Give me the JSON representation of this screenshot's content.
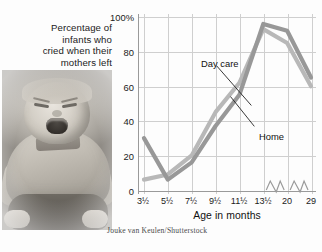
{
  "title_lines": [
    "Percentage of",
    "infants who",
    "cried when their",
    "mothers left"
  ],
  "credit": "Jouke van Keulen/Shutterstock",
  "photo": {
    "alt_name": "crying-infant-photo"
  },
  "chart_data": {
    "type": "line",
    "title": "Percentage of infants who cried when their mothers left",
    "xlabel": "Age in months",
    "ylabel": "",
    "categories": [
      "3½",
      "5½",
      "7½",
      "9½",
      "11½",
      "13½",
      "20",
      "29"
    ],
    "x_tick_labels": [
      "3½",
      "5½",
      "7½",
      "9½",
      "11½",
      "13½",
      "20",
      "29"
    ],
    "y_tick_labels": [
      "0",
      "20",
      "40",
      "60",
      "80",
      "100%"
    ],
    "y_tick_values": [
      0,
      20,
      40,
      60,
      80,
      100
    ],
    "ylim": [
      0,
      100
    ],
    "grid": true,
    "legend": "inline-annotations",
    "axis_breaks": true,
    "series": [
      {
        "name": "Day care",
        "color": "#b8b8b8",
        "values": [
          6,
          9,
          20,
          45,
          62,
          93,
          85,
          60
        ]
      },
      {
        "name": "Home",
        "color": "#989898",
        "values": [
          30,
          6,
          16,
          37,
          55,
          96,
          92,
          65
        ]
      }
    ],
    "annotations": [
      {
        "text": "Day care",
        "points_to_series": "Day care"
      },
      {
        "text": "Home",
        "points_to_series": "Home"
      }
    ]
  }
}
